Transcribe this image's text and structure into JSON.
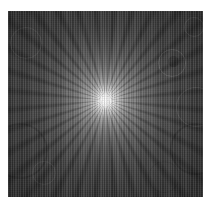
{
  "figure": {
    "name": "radial-starburst-exposure",
    "kind": "grayscale-sunburst-image",
    "canvas": {
      "width_px": 211,
      "height_px": 205,
      "background_color": "#ffffff"
    },
    "plate": {
      "left_px": 8,
      "top_px": 11,
      "width_px": 195,
      "height_px": 186,
      "border_margin_color": "#ffffff",
      "field_color": "#3e3e3e"
    },
    "burst": {
      "center_x_pct": 50,
      "center_y_pct": 48,
      "ray_count": 32,
      "ray_period_deg": 11.25,
      "ray_color": "#000000",
      "hotspot_color": "#ffffff",
      "glow_falloff_pct": 90
    },
    "vignette": {
      "enabled": true,
      "edge_color": "#000000",
      "start_pct": 38,
      "max_opacity": 0.4
    },
    "texture": {
      "type": "vertical-halftone-screen",
      "line_pitch_px": 1.7,
      "light_color": "#ffffff",
      "dark_color": "#000000"
    },
    "artifacts": {
      "label": "lens-flare-bokeh-discs",
      "count": 9,
      "discs": [
        {
          "name": "bokeh-a",
          "shape": "ring",
          "left_px": 150,
          "top_px": 38,
          "size_px": 26
        },
        {
          "name": "bokeh-b",
          "shape": "solid",
          "left_px": 160,
          "top_px": 45,
          "size_px": 11
        },
        {
          "name": "bokeh-c",
          "shape": "ring",
          "left_px": 168,
          "top_px": 76,
          "size_px": 38
        },
        {
          "name": "bokeh-d",
          "shape": "ring",
          "left_px": 162,
          "top_px": 112,
          "size_px": 48
        },
        {
          "name": "bokeh-e",
          "shape": "ring",
          "left_px": -16,
          "top_px": 112,
          "size_px": 52
        },
        {
          "name": "bokeh-f",
          "shape": "ring",
          "left_px": 2,
          "top_px": 16,
          "size_px": 30
        },
        {
          "name": "bokeh-g",
          "shape": "ring",
          "left_px": 176,
          "top_px": 6,
          "size_px": 18
        },
        {
          "name": "bokeh-h",
          "shape": "ring",
          "left_px": 24,
          "top_px": 150,
          "size_px": 22
        },
        {
          "name": "bokeh-i",
          "shape": "ring",
          "left_px": 140,
          "top_px": 150,
          "size_px": 30
        }
      ]
    }
  }
}
